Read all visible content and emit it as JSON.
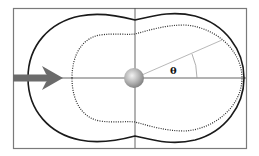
{
  "diagram": {
    "title": "",
    "labels": {
      "angle": "θ"
    },
    "elements": {
      "frame": "bounding-box",
      "axes": [
        "horizontal-axis",
        "vertical-axis"
      ],
      "incident_arrow": "incident-direction-arrow",
      "scatterer": "sphere",
      "outer_pattern": "solid-curve",
      "inner_pattern": "dotted-curve",
      "angle_ray": "angle-ray"
    },
    "colors": {
      "frame": "#7a7a7a",
      "axes": "#555555",
      "outer_curve": "#1a1a1a",
      "inner_curve": "#2a2a2a",
      "arrow": "#6b6b6b",
      "ray": "#b0b0b0",
      "sphere_light": "#e8e8e8",
      "sphere_dark": "#8a8a8a"
    }
  }
}
